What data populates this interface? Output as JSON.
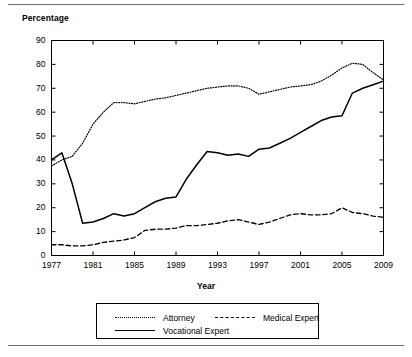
{
  "figure": {
    "y_axis_title": "Percentage",
    "x_axis_title": "Year"
  },
  "legend": {
    "items": [
      {
        "label": "Attorney",
        "style": "dotted",
        "color": "#000000"
      },
      {
        "label": "Medical Expert",
        "style": "dashed",
        "color": "#000000"
      },
      {
        "label": "Vocational Expert",
        "style": "solid",
        "color": "#000000"
      }
    ]
  },
  "chart_data": {
    "type": "line",
    "title": "",
    "xlabel": "Year",
    "ylabel": "Percentage",
    "xlim": [
      1977,
      2009
    ],
    "ylim": [
      0,
      90
    ],
    "yticks": [
      0,
      10,
      20,
      30,
      40,
      50,
      60,
      70,
      80,
      90
    ],
    "xticks": [
      1977,
      1981,
      1985,
      1989,
      1993,
      1997,
      2001,
      2005,
      2009
    ],
    "grid": false,
    "legend_position": "below",
    "x": [
      1977,
      1978,
      1979,
      1980,
      1981,
      1982,
      1983,
      1984,
      1985,
      1986,
      1987,
      1988,
      1989,
      1990,
      1991,
      1992,
      1993,
      1994,
      1995,
      1996,
      1997,
      1998,
      1999,
      2000,
      2001,
      2002,
      2003,
      2004,
      2005,
      2006,
      2007,
      2008,
      2009
    ],
    "series": [
      {
        "name": "Attorney",
        "style": "dotted",
        "values": [
          37.5,
          40.0,
          41.5,
          47.0,
          55.0,
          60.0,
          64.0,
          64.0,
          63.5,
          64.5,
          65.5,
          66.0,
          67.0,
          68.0,
          69.0,
          70.0,
          70.5,
          71.0,
          71.0,
          70.0,
          67.5,
          68.5,
          69.5,
          70.5,
          71.0,
          71.5,
          73.0,
          75.5,
          78.5,
          80.5,
          80.0,
          76.5,
          73.5
        ]
      },
      {
        "name": "Medical Expert",
        "style": "dashed",
        "values": [
          4.5,
          4.5,
          4.0,
          4.0,
          4.5,
          5.5,
          6.0,
          6.5,
          7.5,
          10.5,
          11.0,
          11.0,
          11.5,
          12.5,
          12.5,
          13.0,
          13.5,
          14.5,
          15.0,
          14.0,
          13.0,
          14.0,
          15.5,
          17.0,
          17.5,
          17.0,
          17.0,
          17.5,
          20.0,
          18.0,
          17.5,
          16.5,
          16.0
        ]
      },
      {
        "name": "Vocational Expert",
        "style": "solid",
        "values": [
          40.0,
          43.0,
          30.0,
          13.5,
          14.0,
          15.5,
          17.5,
          16.5,
          17.5,
          20.0,
          22.5,
          24.0,
          24.5,
          32.0,
          38.0,
          43.5,
          43.0,
          42.0,
          42.5,
          41.5,
          44.5,
          45.0,
          47.0,
          49.0,
          51.5,
          54.0,
          56.5,
          58.0,
          58.5,
          68.0,
          70.0,
          71.5,
          73.0
        ]
      }
    ]
  }
}
